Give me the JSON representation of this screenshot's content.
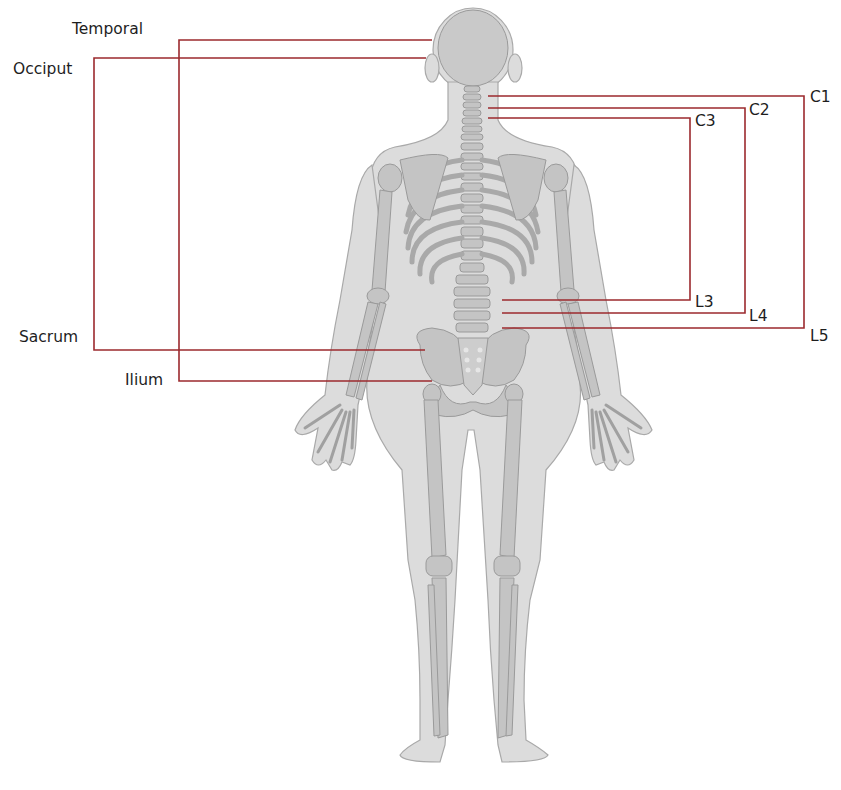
{
  "diagram": {
    "line_color": "#9c2a2e",
    "body_fill": "#dcdcdc",
    "body_stroke": "#a9a9a9",
    "bone_fill": "#bfbfbf",
    "bone_stroke": "#9a9a9a",
    "labels": {
      "temporal": "Temporal",
      "occiput": "Occiput",
      "sacrum": "Sacrum",
      "ilium": "Ilium",
      "c1": "C1",
      "c2": "C2",
      "c3": "C3",
      "l3": "L3",
      "l4": "L4",
      "l5": "L5"
    },
    "leaders": [
      {
        "label": "Temporal",
        "side": "left",
        "target": "skull-temporal",
        "points": [
          [
            432,
            40
          ],
          [
            179,
            40
          ],
          [
            179,
            381
          ],
          [
            432,
            381
          ]
        ],
        "pairs_with": "Ilium"
      },
      {
        "label": "Occiput",
        "side": "left",
        "target": "skull-occiput",
        "points": [
          [
            426,
            58
          ],
          [
            94,
            58
          ],
          [
            94,
            350
          ],
          [
            425,
            350
          ]
        ],
        "pairs_with": "Sacrum"
      },
      {
        "label": "C1",
        "side": "right",
        "target": "vertebra-C1",
        "points": [
          [
            488,
            96
          ],
          [
            804,
            96
          ],
          [
            804,
            328
          ],
          [
            502,
            328
          ]
        ],
        "pairs_with": "L5"
      },
      {
        "label": "C2",
        "side": "right",
        "target": "vertebra-C2",
        "points": [
          [
            488,
            108
          ],
          [
            745,
            108
          ],
          [
            745,
            313
          ],
          [
            502,
            313
          ]
        ],
        "pairs_with": "L4"
      },
      {
        "label": "C3",
        "side": "right",
        "target": "vertebra-C3",
        "points": [
          [
            488,
            118
          ],
          [
            690,
            118
          ],
          [
            690,
            300
          ],
          [
            502,
            300
          ]
        ],
        "pairs_with": "L3"
      }
    ]
  }
}
